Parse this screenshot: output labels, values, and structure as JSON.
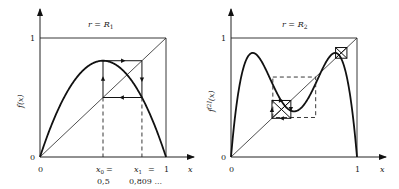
{
  "chart_data": [
    {
      "type": "line",
      "title": "r = R₁",
      "xlabel": "x",
      "ylabel": "f(x)",
      "xlim": [
        0,
        1
      ],
      "ylim": [
        0,
        1
      ],
      "x_ticks": [
        "0",
        "1"
      ],
      "y_ticks": [
        "0",
        "1"
      ],
      "function": "f(x) = r·x·(1−x)",
      "r": 3.2361,
      "series": [
        {
          "name": "f(x)",
          "style": "thick-solid"
        },
        {
          "name": "diagonal y=x",
          "style": "thin-solid"
        },
        {
          "name": "cobweb 2-cycle",
          "style": "solid-with-arrows",
          "points": [
            [
              0.5,
              0.5
            ],
            [
              0.5,
              0.809
            ],
            [
              0.809,
              0.809
            ],
            [
              0.809,
              0.5
            ],
            [
              0.5,
              0.5
            ]
          ]
        },
        {
          "name": "projection lines",
          "style": "dashed",
          "x": [
            0.5,
            0.809
          ]
        }
      ],
      "annotations": [
        {
          "label": "x₀ =",
          "value": "0,5",
          "x": 0.5
        },
        {
          "label": "x₁ =",
          "value": "0,809 ...",
          "x": 0.809
        }
      ],
      "grid": false
    },
    {
      "type": "line",
      "title": "r = R₂",
      "xlabel": "x",
      "ylabel": "f[2](x)",
      "xlim": [
        0,
        1
      ],
      "ylim": [
        0,
        1
      ],
      "x_ticks": [
        "0",
        "1"
      ],
      "y_ticks": [
        "0",
        "1"
      ],
      "function": "f[2](x) = f(f(x))",
      "r": 3.4986,
      "series": [
        {
          "name": "f[2](x)",
          "style": "thick-solid"
        },
        {
          "name": "diagonal y=x",
          "style": "thin-solid"
        },
        {
          "name": "dashed square",
          "style": "dashed",
          "box": [
            0.332,
            0.672
          ]
        },
        {
          "name": "small cobweb boxes",
          "style": "solid-with-arrows",
          "centers": [
            [
              0.4,
              0.4
            ],
            [
              0.875,
              0.875
            ]
          ]
        }
      ],
      "grid": false
    }
  ],
  "left": {
    "title": "r = R",
    "title_sub": "1",
    "ylabel_f": "f",
    "ylabel_x": "(x)",
    "tick_one": "1",
    "tick_zero_y": "0",
    "tick_zero_x": "0",
    "tick_one_x": "1",
    "xlabel": "x",
    "x0_label": "x",
    "x0_sub": "0",
    "x0_eq": "=",
    "x0_value": "0,5",
    "x1_label": "x",
    "x1_sub": "1",
    "x1_eq": "=",
    "x1_value": "0,809 ..."
  },
  "right": {
    "title": "r = R",
    "title_sub": "2",
    "ylabel": "f[2](x)",
    "tick_one": "1",
    "tick_zero_y": "0",
    "tick_zero_x": "0",
    "tick_one_x": "1",
    "xlabel": "x"
  }
}
